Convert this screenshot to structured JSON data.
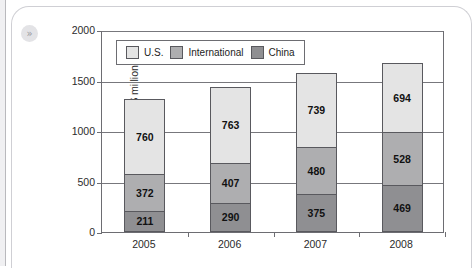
{
  "card": {
    "expand_badge_icon": "double-chevron-right-icon",
    "expand_badge_glyph": "»"
  },
  "chart_data": {
    "type": "bar",
    "subtype": "stacked-vertical",
    "title": "",
    "subtitle": "",
    "xlabel": "",
    "ylabel": "Op. profits (in $ millions)",
    "categories": [
      "2005",
      "2006",
      "2007",
      "2008"
    ],
    "ylim": [
      0,
      2000
    ],
    "yticks": [
      0,
      500,
      1000,
      1500,
      2000
    ],
    "ytick_labels": [
      "0",
      "500",
      "1000",
      "1500",
      "2000"
    ],
    "grid": true,
    "grid_axis": "y",
    "legend_position": "top-left-inside",
    "stack_order_bottom_to_top": [
      "China",
      "International",
      "U.S."
    ],
    "series": [
      {
        "name": "China",
        "color": "#8f8f92",
        "values": [
          211,
          290,
          375,
          469
        ],
        "labels": [
          "211",
          "290",
          "375",
          "469"
        ]
      },
      {
        "name": "International",
        "color": "#aeaeb0",
        "values": [
          372,
          407,
          480,
          528
        ],
        "labels": [
          "372",
          "407",
          "480",
          "528"
        ]
      },
      {
        "name": "U.S.",
        "color": "#e4e4e4",
        "values": [
          760,
          763,
          739,
          694
        ],
        "labels": [
          "760",
          "763",
          "739",
          "694"
        ]
      }
    ],
    "totals": [
      1343,
      1460,
      1594,
      1691
    ],
    "legend": [
      {
        "label": "U.S.",
        "color": "#e4e4e4"
      },
      {
        "label": "International",
        "color": "#aeaeb0"
      },
      {
        "label": "China",
        "color": "#8f8f92"
      }
    ],
    "colors": {
      "us": "#e4e4e4",
      "international": "#aeaeb0",
      "china": "#8f8f92",
      "axis": "#6d6d72",
      "grid": "#77777c",
      "bar_outline": "#59595e",
      "plot_background": "#ffffff",
      "text": "#2b2b2b"
    }
  }
}
